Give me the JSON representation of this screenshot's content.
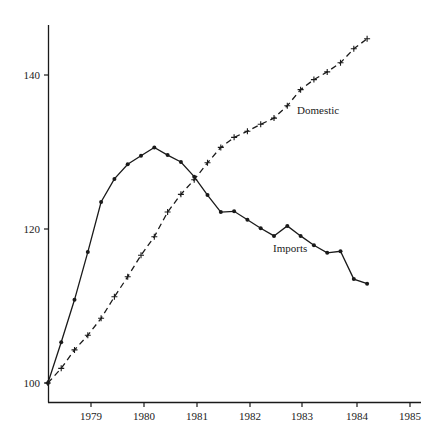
{
  "chart_data": {
    "type": "line",
    "title": "",
    "xlabel": "",
    "ylabel": "",
    "xlim": [
      1978.19,
      1985.2
    ],
    "ylim": [
      96.5,
      147.5
    ],
    "x_ticks": [
      1979,
      1980,
      1981,
      1982,
      1983,
      1984,
      1985
    ],
    "x_tick_labels": [
      "1979",
      "1980",
      "1981",
      "1982",
      "1983",
      "1984",
      "1985"
    ],
    "y_ticks": [
      100,
      120,
      140
    ],
    "y_tick_labels": [
      "100",
      "120",
      "140"
    ],
    "grid": false,
    "legend": "inline labels",
    "x": [
      1978.19,
      1978.44,
      1978.69,
      1978.94,
      1979.19,
      1979.44,
      1979.69,
      1979.94,
      1980.19,
      1980.44,
      1980.69,
      1980.94,
      1981.19,
      1981.44,
      1981.69,
      1981.94,
      1982.19,
      1982.44,
      1982.69,
      1982.94,
      1983.19,
      1983.44,
      1983.69,
      1983.94,
      1984.19
    ],
    "series": [
      {
        "name": "Imports",
        "style": "solid line, dot markers",
        "values": [
          100.0,
          105.3,
          110.8,
          117.0,
          123.5,
          126.5,
          128.4,
          129.5,
          130.6,
          129.6,
          128.7,
          126.8,
          124.4,
          122.2,
          122.3,
          121.2,
          120.1,
          119.1,
          120.4,
          119.1,
          117.9,
          116.9,
          117.1,
          113.5,
          112.9
        ]
      },
      {
        "name": "Domestic",
        "style": "dashed line, plus markers",
        "values": [
          100.0,
          101.9,
          104.3,
          106.2,
          108.4,
          111.2,
          113.8,
          116.6,
          119.0,
          122.2,
          124.5,
          126.4,
          128.6,
          130.6,
          131.9,
          132.7,
          133.6,
          134.4,
          136.0,
          138.1,
          139.4,
          140.4,
          141.6,
          143.4,
          144.7
        ]
      }
    ],
    "annotations": [
      {
        "text": "Domestic",
        "x": 1982.95,
        "y": 134.0
      },
      {
        "text": "Imports",
        "x": 1982.5,
        "y": 117.6
      }
    ]
  },
  "labels": {
    "domestic": "Domestic",
    "imports": "Imports",
    "y_100": "100",
    "y_120": "120",
    "y_140": "140",
    "x_1979": "1979",
    "x_1980": "1980",
    "x_1981": "1981",
    "x_1982": "1982",
    "x_1983": "1983",
    "x_1984": "1984",
    "x_1985": "1985"
  },
  "colors": {
    "ink": "#1a1a1a",
    "background": "#ffffff"
  }
}
